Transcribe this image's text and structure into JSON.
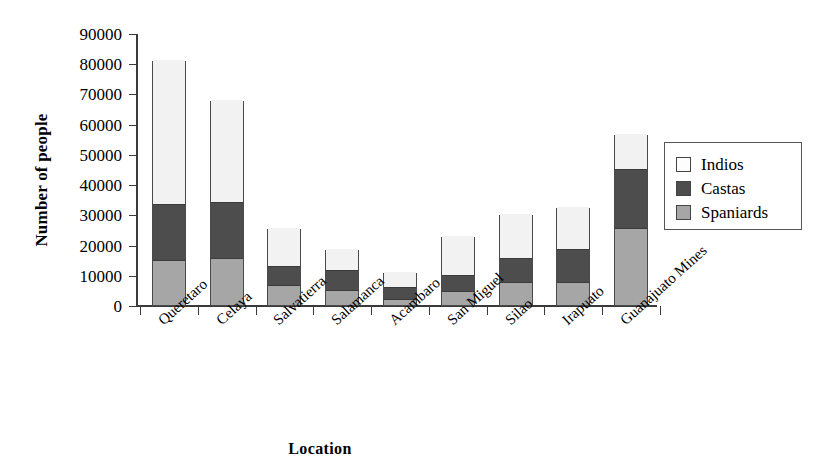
{
  "chart_data": {
    "type": "bar",
    "subtype": "stacked-vertical",
    "title": "",
    "xlabel": "Location",
    "ylabel": "Number of people",
    "ylim": [
      0,
      90000
    ],
    "ytick_values": [
      0,
      10000,
      20000,
      30000,
      40000,
      50000,
      60000,
      70000,
      80000,
      90000
    ],
    "ytick_labels": [
      "0",
      "10000",
      "20000",
      "30000",
      "40000",
      "50000",
      "60000",
      "70000",
      "80000",
      "90000"
    ],
    "grid": false,
    "legend_position": "right",
    "categories": [
      "Queretaro",
      "Celaya",
      "Salvatierra",
      "Salamanca",
      "Acambaro",
      "San Miguel",
      "Silao",
      "Irapuato",
      "Guanajuato Mines"
    ],
    "series": [
      {
        "name": "Spaniards",
        "color": "#a6a6a6",
        "values": [
          15000,
          15500,
          6500,
          5000,
          2000,
          4500,
          7500,
          7500,
          25500
        ]
      },
      {
        "name": "Castas",
        "color": "#4d4d4d",
        "values": [
          18500,
          18500,
          6500,
          6500,
          4000,
          5500,
          8000,
          11000,
          19500
        ]
      },
      {
        "name": "Indios",
        "color": "#f2f2f2",
        "values": [
          47500,
          34000,
          12500,
          7000,
          5000,
          13000,
          14500,
          14000,
          11500
        ]
      }
    ],
    "totals": [
      81000,
      68000,
      25500,
      18500,
      11000,
      23000,
      30000,
      32500,
      56500
    ]
  },
  "legend": {
    "items": [
      {
        "label": "Indios",
        "swatch": "indios"
      },
      {
        "label": "Castas",
        "swatch": "castas"
      },
      {
        "label": "Spaniards",
        "swatch": "spaniards"
      }
    ]
  }
}
